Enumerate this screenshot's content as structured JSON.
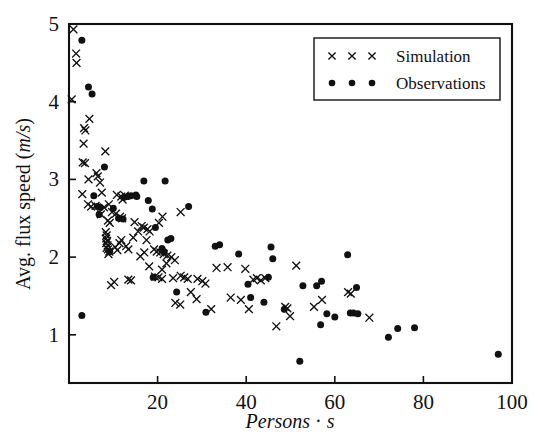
{
  "chart_data": {
    "type": "scatter",
    "title": "",
    "xlabel": "Persons · s",
    "ylabel": "Avg. flux speed (m/s)",
    "ylabel_parts": {
      "prefix": "Avg. flux speed (",
      "italic": "m/s",
      "suffix": ")"
    },
    "xlabel_parts": {
      "italic": "Persons",
      "sep": " · ",
      "italic2": "s"
    },
    "xlim": [
      0,
      100
    ],
    "ylim": [
      0.38,
      5.0
    ],
    "xticks": [
      20,
      40,
      60,
      80,
      100
    ],
    "yticks": [
      1,
      2,
      3,
      4,
      5
    ],
    "xtick_labels": [
      "20",
      "40",
      "60",
      "80",
      "100"
    ],
    "ytick_labels": [
      "1",
      "2",
      "3",
      "4",
      "5"
    ],
    "grid": false,
    "legend_position": "top-right",
    "series": [
      {
        "name": "Simulation",
        "marker": "x",
        "color": "#111111",
        "points": [
          [
            1.0,
            4.93
          ],
          [
            1.6,
            4.62
          ],
          [
            1.7,
            4.5
          ],
          [
            0.6,
            4.03
          ],
          [
            4.6,
            3.78
          ],
          [
            3.4,
            3.66
          ],
          [
            3.7,
            3.63
          ],
          [
            3.3,
            3.46
          ],
          [
            8.2,
            3.36
          ],
          [
            3.1,
            3.22
          ],
          [
            3.6,
            3.21
          ],
          [
            6.2,
            3.08
          ],
          [
            6.5,
            3.04
          ],
          [
            4.4,
            3.0
          ],
          [
            7.0,
            2.96
          ],
          [
            3.0,
            2.81
          ],
          [
            7.4,
            2.83
          ],
          [
            4.3,
            2.68
          ],
          [
            5.0,
            2.65
          ],
          [
            7.9,
            2.64
          ],
          [
            10.8,
            2.8
          ],
          [
            11.8,
            2.78
          ],
          [
            12.6,
            2.79
          ],
          [
            12.1,
            2.74
          ],
          [
            9.7,
            2.58
          ],
          [
            10.6,
            2.56
          ],
          [
            11.5,
            2.52
          ],
          [
            12.0,
            2.5
          ],
          [
            8.8,
            2.47
          ],
          [
            9.2,
            2.44
          ],
          [
            14.8,
            2.45
          ],
          [
            16.4,
            2.4
          ],
          [
            16.9,
            2.38
          ],
          [
            17.7,
            2.36
          ],
          [
            18.2,
            2.33
          ],
          [
            15.6,
            2.33
          ],
          [
            20.3,
            2.44
          ],
          [
            21.1,
            2.52
          ],
          [
            25.2,
            2.58
          ],
          [
            8.3,
            2.32
          ],
          [
            8.5,
            2.28
          ],
          [
            8.4,
            2.24
          ],
          [
            8.6,
            2.21
          ],
          [
            8.4,
            2.18
          ],
          [
            8.7,
            2.15
          ],
          [
            8.5,
            2.12
          ],
          [
            8.8,
            2.1
          ],
          [
            9.1,
            2.07
          ],
          [
            8.9,
            2.04
          ],
          [
            10.4,
            2.13
          ],
          [
            10.9,
            2.09
          ],
          [
            11.4,
            2.18
          ],
          [
            11.8,
            2.22
          ],
          [
            12.9,
            2.14
          ],
          [
            13.4,
            2.1
          ],
          [
            19.2,
            2.1
          ],
          [
            19.8,
            2.07
          ],
          [
            20.6,
            2.06
          ],
          [
            21.4,
            2.04
          ],
          [
            22.2,
            2.02
          ],
          [
            23.1,
            2.0
          ],
          [
            16.1,
            2.01
          ],
          [
            17.0,
            2.06
          ],
          [
            18.1,
            1.88
          ],
          [
            21.0,
            1.84
          ],
          [
            23.9,
            1.96
          ],
          [
            9.5,
            1.64
          ],
          [
            10.2,
            1.68
          ],
          [
            13.4,
            1.71
          ],
          [
            14.0,
            1.7
          ],
          [
            19.4,
            1.75
          ],
          [
            20.2,
            1.74
          ],
          [
            21.0,
            1.72
          ],
          [
            23.5,
            1.73
          ],
          [
            25.2,
            1.76
          ],
          [
            26.0,
            1.74
          ],
          [
            26.8,
            1.72
          ],
          [
            29.0,
            1.72
          ],
          [
            30.1,
            1.69
          ],
          [
            30.8,
            1.66
          ],
          [
            24.0,
            1.41
          ],
          [
            25.1,
            1.39
          ],
          [
            28.8,
            1.46
          ],
          [
            32.1,
            1.33
          ],
          [
            33.3,
            1.86
          ],
          [
            35.8,
            1.87
          ],
          [
            39.8,
            1.85
          ],
          [
            36.5,
            1.48
          ],
          [
            38.8,
            1.45
          ],
          [
            40.6,
            1.33
          ],
          [
            41.6,
            1.71
          ],
          [
            42.4,
            1.73
          ],
          [
            43.3,
            1.7
          ],
          [
            44.3,
            1.73
          ],
          [
            46.8,
            1.11
          ],
          [
            48.8,
            1.36
          ],
          [
            49.3,
            1.34
          ],
          [
            49.9,
            1.24
          ],
          [
            51.3,
            1.89
          ],
          [
            55.3,
            1.36
          ],
          [
            57.1,
            1.45
          ],
          [
            63.0,
            1.55
          ],
          [
            63.6,
            1.53
          ],
          [
            67.8,
            1.22
          ],
          [
            6.0,
            2.66
          ],
          [
            7.2,
            2.55
          ],
          [
            9.0,
            2.68
          ],
          [
            14.5,
            2.25
          ],
          [
            17.5,
            2.22
          ],
          [
            22.0,
            1.92
          ],
          [
            27.5,
            1.55
          ]
        ]
      },
      {
        "name": "Observations",
        "marker": "o",
        "color": "#111111",
        "points": [
          [
            2.9,
            4.79
          ],
          [
            4.4,
            4.19
          ],
          [
            5.2,
            4.1
          ],
          [
            2.9,
            1.25
          ],
          [
            8.0,
            3.16
          ],
          [
            5.6,
            2.79
          ],
          [
            6.4,
            2.65
          ],
          [
            7.1,
            2.64
          ],
          [
            6.8,
            2.55
          ],
          [
            12.4,
            2.77
          ],
          [
            13.3,
            2.78
          ],
          [
            14.0,
            2.79
          ],
          [
            15.1,
            2.8
          ],
          [
            15.3,
            2.78
          ],
          [
            16.9,
            2.98
          ],
          [
            21.7,
            2.98
          ],
          [
            17.9,
            2.73
          ],
          [
            10.0,
            2.63
          ],
          [
            11.2,
            2.5
          ],
          [
            12.2,
            2.49
          ],
          [
            18.8,
            2.62
          ],
          [
            27.0,
            2.65
          ],
          [
            19.5,
            2.38
          ],
          [
            22.3,
            2.22
          ],
          [
            23.0,
            2.24
          ],
          [
            21.0,
            2.11
          ],
          [
            21.5,
            2.07
          ],
          [
            9.2,
            2.07
          ],
          [
            24.3,
            1.55
          ],
          [
            19.0,
            1.74
          ],
          [
            30.9,
            1.29
          ],
          [
            33.0,
            2.14
          ],
          [
            34.0,
            2.16
          ],
          [
            38.3,
            2.04
          ],
          [
            40.4,
            1.65
          ],
          [
            41.0,
            1.48
          ],
          [
            44.0,
            1.42
          ],
          [
            45.6,
            2.13
          ],
          [
            46.0,
            1.98
          ],
          [
            45.0,
            1.74
          ],
          [
            48.6,
            1.33
          ],
          [
            52.1,
            0.66
          ],
          [
            52.8,
            1.63
          ],
          [
            55.9,
            1.63
          ],
          [
            57.0,
            1.69
          ],
          [
            56.8,
            1.13
          ],
          [
            58.2,
            1.27
          ],
          [
            60.0,
            1.23
          ],
          [
            62.9,
            2.03
          ],
          [
            63.5,
            1.28
          ],
          [
            64.2,
            1.28
          ],
          [
            65.2,
            1.27
          ],
          [
            64.9,
            1.61
          ],
          [
            72.1,
            0.97
          ],
          [
            74.2,
            1.08
          ],
          [
            78.0,
            1.09
          ],
          [
            96.9,
            0.75
          ]
        ]
      }
    ]
  },
  "legend": {
    "entries": [
      {
        "label": "Simulation",
        "marker": "x"
      },
      {
        "label": "Observations",
        "marker": "o"
      }
    ]
  }
}
